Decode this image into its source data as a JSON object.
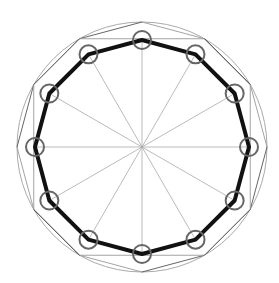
{
  "diagram": {
    "title": "",
    "type": "geometric-construction",
    "center": [
      142,
      147
    ],
    "outer_circle_radius": 125,
    "inner_polygon_radius": 107,
    "vertex_marker_radius": 9,
    "sides": 12,
    "colors": {
      "background": "#ffffff",
      "outer_circle": "#aaaaaa",
      "spokes": "#aaaaaa",
      "construction_light": "#999999",
      "construction_dark": "#555555",
      "main_polygon": "#111111",
      "markers": "#666666"
    }
  }
}
